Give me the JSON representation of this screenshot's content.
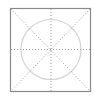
{
  "figure": {
    "type": "guide-grid-icon",
    "colors": {
      "background": "#ffffff",
      "frame": "#8a8a8a",
      "circle": "#d4d4d4",
      "guides": "#9a9a9a"
    },
    "frame": {
      "x": 10,
      "y": 8,
      "width": 81,
      "height": 84
    },
    "circle": {
      "cx": 51,
      "cy": 49,
      "r": 30
    },
    "guides": [
      "horizontal",
      "vertical",
      "diagonal-down",
      "diagonal-up"
    ]
  }
}
